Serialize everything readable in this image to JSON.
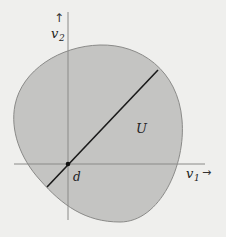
{
  "diagram": {
    "region_label": "U",
    "point_label": "d",
    "x_axis": {
      "label": "v",
      "subscript": "1",
      "arrow": "→"
    },
    "y_axis": {
      "label": "v",
      "subscript": "2",
      "arrow": "↑"
    },
    "colors": {
      "background": "#efefed",
      "region_fill": "#c4c4c2",
      "region_stroke": "#8a8a88",
      "axis": "#8a8a88",
      "segment": "#1a1a1a"
    }
  }
}
